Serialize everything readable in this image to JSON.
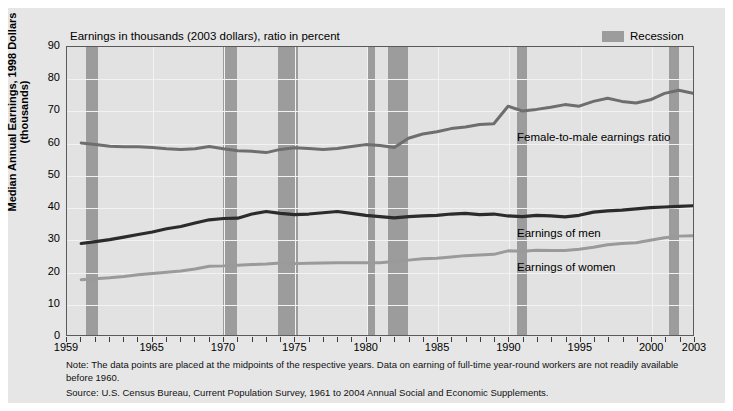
{
  "chart_data": {
    "type": "line",
    "title": "Earnings in thousands (2003 dollars), ratio in percent",
    "xlabel": "",
    "ylabel": "Median Annual Earnings, 1998 Dollars (thousands)",
    "xlim": [
      1959,
      2003
    ],
    "ylim": [
      0,
      90
    ],
    "grid": true,
    "legend_position": "top-right",
    "yticks": [
      90,
      80,
      70,
      60,
      50,
      40,
      30,
      20,
      10,
      0
    ],
    "xticks": [
      1959,
      1965,
      1970,
      1975,
      1980,
      1985,
      1990,
      1995,
      2000,
      2003
    ],
    "x": [
      1960,
      1961,
      1962,
      1963,
      1964,
      1965,
      1966,
      1967,
      1968,
      1969,
      1970,
      1971,
      1972,
      1973,
      1974,
      1975,
      1976,
      1977,
      1978,
      1979,
      1980,
      1981,
      1982,
      1983,
      1984,
      1985,
      1986,
      1987,
      1988,
      1989,
      1990,
      1991,
      1992,
      1993,
      1994,
      1995,
      1996,
      1997,
      1998,
      1999,
      2000,
      2001,
      2002,
      2003
    ],
    "series": [
      {
        "name": "Female-to-male earnings ratio",
        "color": "#6e6e6e",
        "values": [
          60.0,
          59.5,
          59.0,
          58.8,
          58.8,
          58.6,
          58.2,
          58.0,
          58.2,
          58.9,
          58.2,
          57.6,
          57.4,
          57.0,
          58.0,
          58.5,
          58.3,
          58.0,
          58.3,
          58.9,
          59.5,
          59.2,
          58.6,
          61.5,
          62.8,
          63.5,
          64.5,
          65.0,
          65.8,
          66.0,
          71.5,
          70.0,
          70.5,
          71.2,
          72.0,
          71.5,
          73.0,
          74.0,
          73.0,
          72.5,
          73.5,
          75.5,
          76.5,
          75.5
        ]
      },
      {
        "name": "Earnings of men",
        "color": "#2b2b2b",
        "values": [
          28.6,
          29.2,
          29.8,
          30.6,
          31.4,
          32.2,
          33.2,
          33.9,
          35.0,
          36.0,
          36.4,
          36.5,
          37.8,
          38.6,
          38.0,
          37.6,
          37.8,
          38.2,
          38.6,
          38.0,
          37.4,
          37.0,
          36.6,
          37.0,
          37.2,
          37.4,
          37.8,
          38.0,
          37.6,
          37.8,
          37.2,
          37.0,
          37.4,
          37.2,
          36.9,
          37.4,
          38.4,
          38.8,
          39.0,
          39.4,
          39.8,
          40.0,
          40.2,
          40.4
        ]
      },
      {
        "name": "Earnings of women",
        "color": "#9a9a9a",
        "values": [
          17.3,
          17.6,
          17.9,
          18.3,
          18.8,
          19.2,
          19.6,
          20.0,
          20.6,
          21.5,
          21.6,
          21.8,
          22.0,
          22.2,
          22.5,
          22.3,
          22.4,
          22.5,
          22.6,
          22.6,
          22.6,
          22.6,
          23.0,
          23.4,
          23.8,
          24.0,
          24.4,
          24.8,
          25.0,
          25.2,
          26.3,
          26.2,
          26.5,
          26.4,
          26.4,
          26.8,
          27.4,
          28.2,
          28.6,
          28.8,
          29.6,
          30.4,
          30.9,
          31.0
        ]
      }
    ],
    "recessions": [
      {
        "start": 1960.3,
        "end": 1961.2
      },
      {
        "start": 1969.9,
        "end": 1970.9
      },
      {
        "start": 1973.8,
        "end": 1975.2
      },
      {
        "start": 1980.0,
        "end": 1980.6
      },
      {
        "start": 1981.5,
        "end": 1982.9
      },
      {
        "start": 1990.5,
        "end": 1991.2
      },
      {
        "start": 2001.2,
        "end": 2001.9
      }
    ],
    "annotations": [
      {
        "text": "Female-to-male earnings ratio",
        "x_px": 508,
        "y_px": 122
      },
      {
        "text": "Earnings of men",
        "x_px": 508,
        "y_px": 218
      },
      {
        "text": "Earnings of women",
        "x_px": 508,
        "y_px": 252
      }
    ]
  },
  "legend": {
    "recession_label": "Recession",
    "recession_color": "#9c9c9c"
  },
  "footnotes": {
    "note": "Note: The data points are placed at the midpoints of the respective years. Data on earning of full-time year-round workers are not readily available before 1960.",
    "source": "Source: U.S. Census Bureau, Current Population Survey, 1961 to 2004 Annual Social and Economic Supplements."
  }
}
